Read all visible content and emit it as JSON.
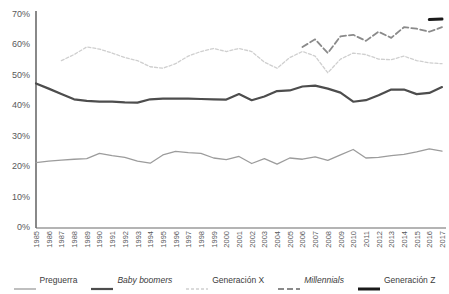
{
  "chart_data": {
    "type": "line",
    "title": "",
    "xlabel": "",
    "ylabel": "",
    "ylim": [
      0,
      70
    ],
    "ytick_labels": [
      "0%",
      "10%",
      "20%",
      "30%",
      "40%",
      "50%",
      "60%",
      "70%"
    ],
    "ytick_values": [
      0,
      10,
      20,
      30,
      40,
      50,
      60,
      70
    ],
    "grid": false,
    "legend_position": "bottom",
    "x": [
      1985,
      1986,
      1987,
      1988,
      1989,
      1990,
      1991,
      1992,
      1993,
      1994,
      1995,
      1996,
      1997,
      1998,
      1999,
      2000,
      2001,
      2002,
      2003,
      2004,
      2005,
      2006,
      2007,
      2008,
      2009,
      2010,
      2011,
      2012,
      2013,
      2014,
      2015,
      2016,
      2017
    ],
    "categories": [
      "1985",
      "1986",
      "1987",
      "1988",
      "1989",
      "1990",
      "1991",
      "1992",
      "1993",
      "1994",
      "1995",
      "1996",
      "1997",
      "1998",
      "1999",
      "2000",
      "2001",
      "2002",
      "2003",
      "2004",
      "2005",
      "2006",
      "2007",
      "2008",
      "2009",
      "2010",
      "2011",
      "2012",
      "2013",
      "2014",
      "2015",
      "2016",
      "2017"
    ],
    "series": [
      {
        "name": "Preguerra",
        "style": "solid-thin",
        "color": "#9c9c9c",
        "values": [
          21.5,
          22.0,
          22.3,
          22.6,
          22.8,
          24.5,
          23.8,
          23.2,
          22.0,
          21.3,
          24.0,
          25.2,
          24.8,
          24.5,
          23.0,
          22.5,
          23.5,
          21.2,
          22.8,
          21.0,
          23.0,
          22.6,
          23.4,
          22.2,
          24.0,
          25.8,
          23.0,
          23.2,
          23.8,
          24.2,
          25.0,
          26.0,
          25.3
        ]
      },
      {
        "name": "Baby boomers",
        "style": "solid-thick",
        "color": "#4d4d4d",
        "values": [
          47.5,
          45.8,
          44.0,
          42.3,
          41.8,
          41.5,
          41.5,
          41.3,
          41.2,
          42.3,
          42.5,
          42.5,
          42.5,
          42.4,
          42.3,
          42.2,
          44.0,
          42.0,
          43.2,
          45.0,
          45.2,
          46.5,
          46.8,
          45.8,
          44.5,
          41.5,
          42.0,
          43.6,
          45.5,
          45.5,
          44.0,
          44.4,
          46.3
        ]
      },
      {
        "name": "Generación X",
        "style": "dotted",
        "color": "#cfcfcf",
        "values": [
          null,
          null,
          55.0,
          57.0,
          59.5,
          58.8,
          57.5,
          56.0,
          55.0,
          53.0,
          52.5,
          54.0,
          56.5,
          58.0,
          59.0,
          58.0,
          59.0,
          58.0,
          54.5,
          52.5,
          56.0,
          58.0,
          56.5,
          51.0,
          55.5,
          57.5,
          57.0,
          55.5,
          55.3,
          56.5,
          55.0,
          54.3,
          54.0
        ]
      },
      {
        "name": "Millennials",
        "style": "dashed",
        "color": "#8a8a8a",
        "values": [
          null,
          null,
          null,
          null,
          null,
          null,
          null,
          null,
          null,
          null,
          null,
          null,
          null,
          null,
          null,
          null,
          null,
          null,
          null,
          null,
          null,
          59.5,
          62.0,
          57.5,
          63.0,
          63.5,
          61.5,
          64.5,
          62.5,
          66.0,
          65.5,
          64.5,
          66.0
        ]
      },
      {
        "name": "Generación Z",
        "style": "solid-black",
        "color": "#1a1a1a",
        "values": [
          null,
          null,
          null,
          null,
          null,
          null,
          null,
          null,
          null,
          null,
          null,
          null,
          null,
          null,
          null,
          null,
          null,
          null,
          null,
          null,
          null,
          null,
          null,
          null,
          null,
          null,
          null,
          null,
          null,
          null,
          null,
          68.5,
          68.7
        ]
      }
    ]
  },
  "legend": {
    "items": [
      {
        "label": "Preguerra",
        "italic": false
      },
      {
        "label": "Baby boomers",
        "italic": true
      },
      {
        "label": "Generación X",
        "italic": false
      },
      {
        "label": "Millennials",
        "italic": true
      },
      {
        "label": "Generación Z",
        "italic": false
      }
    ]
  },
  "axis": {
    "axis_color": "#6b6b6b"
  }
}
